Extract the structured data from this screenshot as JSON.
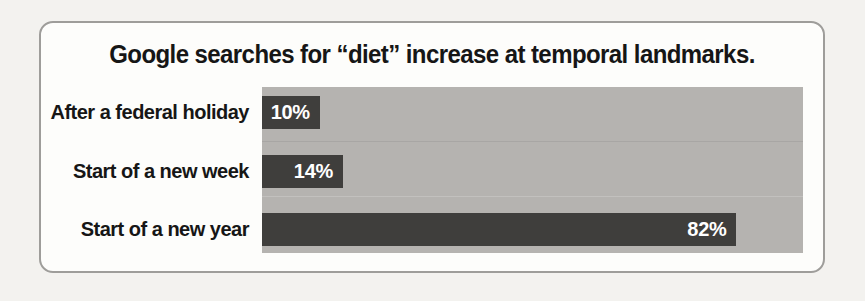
{
  "chart_data": {
    "type": "bar",
    "orientation": "horizontal",
    "title": "Google searches for “diet” increase at temporal landmarks.",
    "categories": [
      "After a federal holiday",
      "Start of a new week",
      "Start of a new year"
    ],
    "values": [
      10,
      14,
      82
    ],
    "value_labels": [
      "10%",
      "14%",
      "82%"
    ],
    "xlabel": "",
    "ylabel": "",
    "xlim": [
      0,
      93.5
    ],
    "grid": false,
    "legend": false,
    "colors": {
      "bar": "#3f3e3c",
      "plot_background": "#b5b3b0",
      "value_text": "#ffffff",
      "label_text": "#161616",
      "card_background": "#fdfdfb",
      "page_background": "#f3f2ef",
      "border": "#9e9d9a"
    }
  }
}
